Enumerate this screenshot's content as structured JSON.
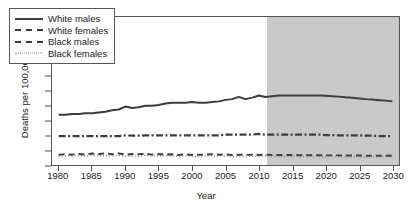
{
  "chart_data": {
    "type": "line",
    "title": "",
    "xlabel": "Year",
    "ylabel": "Deaths per 100,000",
    "xlim": [
      1979,
      2031
    ],
    "ylim": [
      0,
      10
    ],
    "xticks": [
      1980,
      1985,
      1990,
      1995,
      2000,
      2005,
      2010,
      2015,
      2020,
      2025,
      2030
    ],
    "yticks": [
      0,
      1,
      2,
      3,
      4,
      5,
      6,
      7,
      8,
      9,
      10
    ],
    "grid": false,
    "legend_position": "top-left",
    "projection_start": 2011,
    "projection_shading_color": "#c9c9c9",
    "line_color": "#3c3c3c",
    "x": [
      1980,
      1981,
      1982,
      1983,
      1984,
      1985,
      1986,
      1987,
      1988,
      1989,
      1990,
      1991,
      1992,
      1993,
      1994,
      1995,
      1996,
      1997,
      1998,
      1999,
      2000,
      2001,
      2002,
      2003,
      2004,
      2005,
      2006,
      2007,
      2008,
      2009,
      2010,
      2011,
      2012,
      2013,
      2014,
      2015,
      2016,
      2017,
      2018,
      2019,
      2020,
      2021,
      2022,
      2023,
      2024,
      2025,
      2026,
      2027,
      2028,
      2029,
      2030
    ],
    "series": [
      {
        "name": "White males",
        "style": "solid",
        "values": [
          3.4,
          3.4,
          3.45,
          3.45,
          3.5,
          3.5,
          3.55,
          3.6,
          3.7,
          3.75,
          3.95,
          3.85,
          3.9,
          4.0,
          4.0,
          4.05,
          4.15,
          4.2,
          4.2,
          4.2,
          4.25,
          4.2,
          4.2,
          4.25,
          4.3,
          4.4,
          4.45,
          4.6,
          4.45,
          4.55,
          4.7,
          4.6,
          4.65,
          4.7,
          4.7,
          4.7,
          4.7,
          4.7,
          4.7,
          4.7,
          4.68,
          4.65,
          4.62,
          4.58,
          4.55,
          4.5,
          4.45,
          4.42,
          4.38,
          4.35,
          4.3
        ]
      },
      {
        "name": "White females",
        "style": "dashdot",
        "values": [
          1.95,
          1.95,
          1.95,
          1.95,
          1.95,
          1.95,
          1.95,
          1.95,
          1.95,
          1.95,
          2.0,
          1.98,
          1.98,
          2.0,
          2.0,
          2.0,
          2.0,
          2.0,
          2.0,
          2.0,
          2.0,
          2.0,
          2.0,
          2.0,
          2.0,
          2.05,
          2.05,
          2.05,
          2.05,
          2.05,
          2.1,
          2.05,
          2.05,
          2.05,
          2.05,
          2.05,
          2.05,
          2.05,
          2.05,
          2.05,
          2.02,
          2.02,
          2.0,
          2.0,
          2.0,
          2.0,
          1.98,
          1.98,
          1.95,
          1.95,
          1.95
        ]
      },
      {
        "name": "Black males",
        "style": "dashed",
        "values": [
          0.7,
          0.72,
          0.7,
          0.75,
          0.7,
          0.78,
          0.72,
          0.8,
          0.72,
          0.78,
          0.7,
          0.74,
          0.72,
          0.76,
          0.7,
          0.74,
          0.7,
          0.72,
          0.68,
          0.72,
          0.68,
          0.7,
          0.7,
          0.72,
          0.7,
          0.72,
          0.68,
          0.7,
          0.68,
          0.7,
          0.68,
          0.7,
          0.68,
          0.68,
          0.68,
          0.68,
          0.66,
          0.66,
          0.66,
          0.66,
          0.65,
          0.65,
          0.65,
          0.64,
          0.64,
          0.64,
          0.63,
          0.63,
          0.62,
          0.62,
          0.62
        ]
      },
      {
        "name": "Black females",
        "style": "dotted",
        "values": [
          0.6,
          0.62,
          0.6,
          0.64,
          0.6,
          0.66,
          0.6,
          0.66,
          0.6,
          0.64,
          0.6,
          0.62,
          0.6,
          0.64,
          0.6,
          0.62,
          0.6,
          0.62,
          0.58,
          0.62,
          0.58,
          0.6,
          0.6,
          0.62,
          0.6,
          0.62,
          0.58,
          0.6,
          0.58,
          0.6,
          0.58,
          0.6,
          0.58,
          0.58,
          0.58,
          0.58,
          0.57,
          0.57,
          0.57,
          0.57,
          0.56,
          0.56,
          0.56,
          0.55,
          0.55,
          0.55,
          0.55,
          0.54,
          0.54,
          0.54,
          0.54
        ]
      }
    ]
  }
}
